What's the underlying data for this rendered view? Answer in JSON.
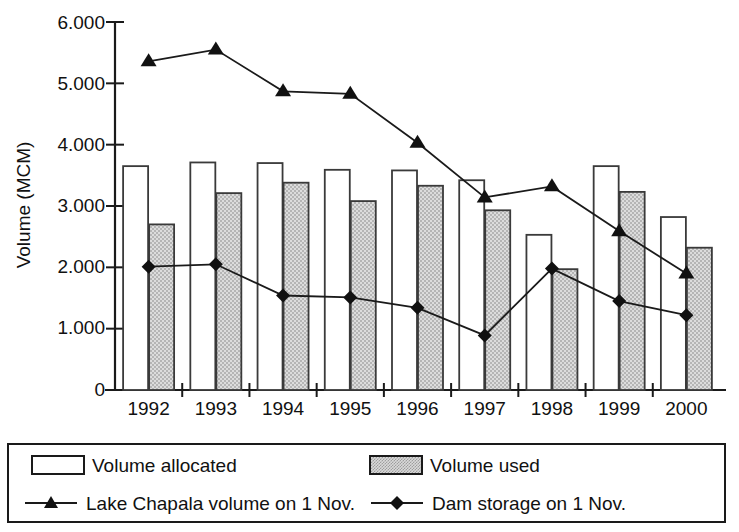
{
  "chart_data": {
    "type": "bar",
    "title": "",
    "xlabel": "",
    "ylabel": "Volume (MCM)",
    "categories": [
      "1992",
      "1993",
      "1994",
      "1995",
      "1996",
      "1997",
      "1998",
      "1999",
      "2000"
    ],
    "ylim": [
      0,
      6000
    ],
    "ytick_labels": [
      "6.000",
      "5.000",
      "4.000",
      "3.000",
      "2.000",
      "1.000",
      "0"
    ],
    "ytick_values": [
      6000,
      5000,
      4000,
      3000,
      2000,
      1000,
      0
    ],
    "grid": false,
    "legend_position": "below-plot",
    "series": [
      {
        "name": "Volume allocated",
        "kind": "bar",
        "style": "white-fill-black-outline",
        "values": [
          3650,
          3710,
          3700,
          3590,
          3580,
          3420,
          2530,
          3650,
          2820
        ]
      },
      {
        "name": "Volume used",
        "kind": "bar",
        "style": "gray-hatched-fill",
        "values": [
          2700,
          3210,
          3380,
          3080,
          3330,
          2930,
          1970,
          3230,
          2320
        ]
      },
      {
        "name": "Lake Chapala volume on 1 Nov.",
        "kind": "line",
        "marker": "triangle",
        "values": [
          5360,
          5550,
          4870,
          4830,
          4030,
          3140,
          3320,
          2590,
          1900
        ]
      },
      {
        "name": "Dam storage on 1 Nov.",
        "kind": "line",
        "marker": "diamond",
        "values": [
          2010,
          2050,
          1540,
          1510,
          1340,
          890,
          1980,
          1450,
          1220
        ]
      }
    ]
  },
  "legend": {
    "items": [
      {
        "label": "Volume allocated",
        "marker": "white-bar-swatch"
      },
      {
        "label": "Volume used",
        "marker": "gray-bar-swatch"
      },
      {
        "label": "Lake Chapala volume on 1 Nov.",
        "marker": "triangle-line-swatch"
      },
      {
        "label": "Dam storage on 1 Nov.",
        "marker": "diamond-line-swatch"
      }
    ]
  },
  "colors": {
    "axis": "#1a1a1a",
    "bar_allocated_fill": "#ffffff",
    "bar_used_fill": "#d9d9d9",
    "line": "#1a1a1a",
    "background": "#ffffff"
  }
}
